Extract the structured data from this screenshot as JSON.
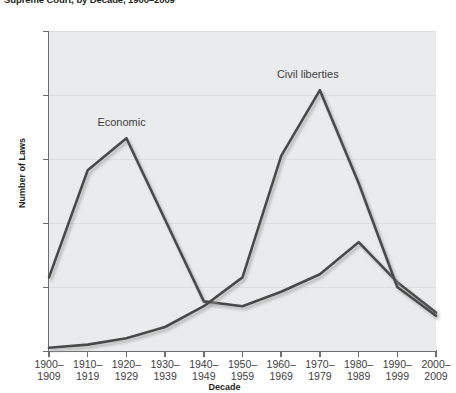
{
  "title": "Supreme Court, by Decade, 1900–2009",
  "axis": {
    "ylabel": "Number of Laws",
    "xlabel": "Decade",
    "yticks": [
      "0",
      "40",
      "80",
      "120",
      "160",
      "200"
    ],
    "xticks": [
      {
        "top": "1900–",
        "bottom": "1909"
      },
      {
        "top": "1910–",
        "bottom": "1919"
      },
      {
        "top": "1920–",
        "bottom": "1929"
      },
      {
        "top": "1930–",
        "bottom": "1939"
      },
      {
        "top": "1940–",
        "bottom": "1949"
      },
      {
        "top": "1950–",
        "bottom": "1959"
      },
      {
        "top": "1960–",
        "bottom": "1969"
      },
      {
        "top": "1970–",
        "bottom": "1979"
      },
      {
        "top": "1980–",
        "bottom": "1989"
      },
      {
        "top": "1990–",
        "bottom": "1999"
      },
      {
        "top": "2000–",
        "bottom": "2009"
      }
    ]
  },
  "annotations": {
    "economic": "Economic",
    "civil_liberties": "Civil liberties"
  },
  "colors": {
    "line": "#4a4a4a",
    "plot_background": "#eaebec",
    "gridline": "#dcdddd",
    "axis": "#6d6e70",
    "text": "#414042"
  },
  "chart_data": {
    "type": "line",
    "title": "Supreme Court, by Decade, 1900–2009",
    "xlabel": "Decade",
    "ylabel": "Number of Laws",
    "ylim": [
      0,
      200
    ],
    "yticks": [
      0,
      40,
      80,
      120,
      160,
      200
    ],
    "grid": true,
    "legend": "inline-annotations",
    "categories": [
      "1900–1909",
      "1910–1919",
      "1920–1929",
      "1930–1939",
      "1940–1949",
      "1950–1959",
      "1960–1969",
      "1970–1979",
      "1980–1989",
      "1990–1999",
      "2000–2009"
    ],
    "series": [
      {
        "name": "Economic",
        "values": [
          46,
          113,
          133,
          82,
          31,
          28,
          37,
          48,
          68,
          43,
          24
        ]
      },
      {
        "name": "Civil liberties",
        "values": [
          2,
          4,
          8,
          15,
          28,
          46,
          122,
          163,
          105,
          40,
          22
        ]
      }
    ]
  }
}
